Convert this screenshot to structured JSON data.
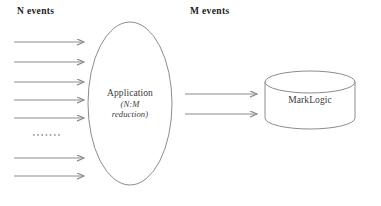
{
  "diagram": {
    "type": "flow-diagram",
    "canvas": {
      "width": 381,
      "height": 206,
      "background": "#ffffff"
    },
    "stroke_color": "#8c8c8c",
    "text_color": "#3b3b3b",
    "heading_color": "#1c1c1c",
    "labels": {
      "input_label": "N events",
      "output_label": "M events"
    },
    "nodes": {
      "application": {
        "shape": "ellipse",
        "title": "Application",
        "subtitle_line1": "(N:M",
        "subtitle_line2": "reduction)",
        "bounds": {
          "x": 88,
          "y": 22,
          "width": 84,
          "height": 163
        }
      },
      "datastore": {
        "shape": "cylinder",
        "title": "MarkLogic",
        "bounds": {
          "x": 265,
          "y": 72,
          "width": 90,
          "height": 56
        }
      }
    },
    "input_arrows": {
      "count": 7,
      "x_start": 14,
      "x_end": 86,
      "y_positions": [
        42,
        62,
        82,
        100,
        118,
        158,
        176
      ]
    },
    "ellipsis": {
      "x_start": 33,
      "x_end": 62,
      "y": 135,
      "dot_count": 7
    },
    "output_arrows": {
      "count": 2,
      "x_start": 185,
      "x_end": 259,
      "y_positions": [
        94,
        114
      ]
    }
  }
}
